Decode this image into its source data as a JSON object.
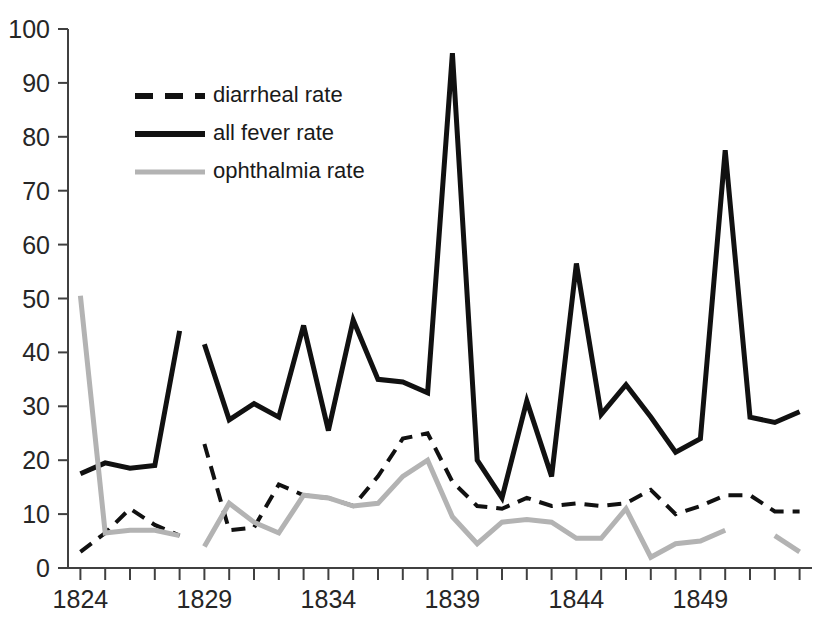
{
  "chart_data": {
    "type": "line",
    "title": "",
    "subtitle": "",
    "xlabel": "",
    "ylabel": "",
    "xlim": [
      1823.5,
      1853.5
    ],
    "ylim": [
      0,
      100
    ],
    "grid": false,
    "legend_position": "upper-left-inside",
    "y_ticks": [
      0,
      10,
      20,
      30,
      40,
      50,
      60,
      70,
      80,
      90,
      100
    ],
    "y_tick_labels": [
      "0",
      "10",
      "20",
      "30",
      "40",
      "50",
      "60",
      "70",
      "80",
      "90",
      "100"
    ],
    "x_ticks": [
      1824,
      1825,
      1826,
      1827,
      1828,
      1829,
      1830,
      1831,
      1832,
      1833,
      1834,
      1835,
      1836,
      1837,
      1838,
      1839,
      1840,
      1841,
      1842,
      1843,
      1844,
      1845,
      1846,
      1847,
      1848,
      1849,
      1850,
      1851,
      1852,
      1853
    ],
    "x_tick_labels_shown": [
      "1824",
      "1829",
      "1834",
      "1839",
      "1844",
      "1849"
    ],
    "x_labeled_ticks": [
      1824,
      1829,
      1834,
      1839,
      1844,
      1849
    ],
    "x": [
      1824,
      1825,
      1826,
      1827,
      1828,
      1829,
      1830,
      1831,
      1832,
      1833,
      1834,
      1835,
      1836,
      1837,
      1838,
      1839,
      1840,
      1841,
      1842,
      1843,
      1844,
      1845,
      1846,
      1847,
      1848,
      1849,
      1850,
      1851,
      1852,
      1853
    ],
    "series": [
      {
        "name": "diarrheal rate",
        "style": "dashed",
        "color": "#111111",
        "width": 4,
        "values": [
          3.0,
          6.5,
          11.0,
          8.0,
          6.0,
          23.0,
          7.0,
          7.5,
          15.5,
          13.5,
          13.0,
          11.5,
          17.0,
          24.0,
          25.0,
          16.0,
          11.5,
          11.0,
          13.0,
          11.5,
          12.0,
          11.5,
          12.0,
          14.5,
          10.0,
          11.5,
          13.5,
          13.5,
          10.5,
          10.5
        ]
      },
      {
        "name": "all fever rate",
        "style": "solid",
        "color": "#111111",
        "width": 5,
        "values": [
          17.5,
          19.5,
          18.5,
          19.0,
          44.0,
          41.5,
          27.5,
          30.5,
          28.0,
          45.0,
          25.5,
          46.0,
          35.0,
          34.5,
          32.5,
          95.5,
          20.0,
          13.0,
          31.0,
          17.0,
          56.5,
          28.5,
          34.0,
          28.0,
          21.5,
          24.0,
          77.5,
          28.0,
          27.0,
          29.0
        ]
      },
      {
        "name": "ophthalmia rate",
        "style": "solid",
        "color": "#b3b3b3",
        "width": 5,
        "values": [
          50.5,
          6.5,
          7.0,
          7.0,
          6.0,
          4.0,
          12.0,
          8.5,
          6.5,
          13.5,
          13.0,
          11.5,
          12.0,
          17.0,
          20.0,
          9.5,
          4.5,
          8.5,
          9.0,
          8.5,
          5.5,
          5.5,
          11.0,
          2.0,
          4.5,
          5.0,
          7.0,
          null,
          6.0,
          3.0
        ]
      }
    ],
    "gaps": [
      {
        "series": "diarrheal rate",
        "between": [
          1828,
          1829
        ]
      },
      {
        "series": "all fever rate",
        "between": [
          1828,
          1829
        ]
      },
      {
        "series": "ophthalmia rate",
        "between": [
          1828,
          1829
        ]
      },
      {
        "series": "ophthalmia rate",
        "between": [
          1850,
          1852
        ]
      }
    ]
  },
  "legend": {
    "items": [
      {
        "label": "diarrheal rate",
        "style": "dashed",
        "color": "#111111"
      },
      {
        "label": "all fever rate",
        "style": "solid",
        "color": "#111111"
      },
      {
        "label": "ophthalmia rate",
        "style": "solid",
        "color": "#b3b3b3"
      }
    ]
  },
  "axis": {
    "y_labels": [
      "100",
      "90",
      "80",
      "70",
      "60",
      "50",
      "40",
      "30",
      "20",
      "10",
      "0"
    ],
    "x_labels": [
      "1824",
      "1829",
      "1834",
      "1839",
      "1844",
      "1849"
    ]
  },
  "colors": {
    "axis": "#404040",
    "black_series": "#111111",
    "gray_series": "#b3b3b3",
    "background": "#ffffff",
    "text": "#262626"
  }
}
